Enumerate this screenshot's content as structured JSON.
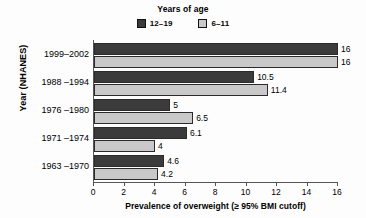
{
  "chart_data": {
    "type": "bar",
    "orientation": "horizontal",
    "title": "",
    "legend_title": "Years of age",
    "legend_position": "top-center",
    "xlabel": "Prevalence of overweight (≥ 95% BMI cutoff)",
    "ylabel": "Year (NHANES)",
    "categories": [
      "1999–2002",
      "1988 –1994",
      "1976 –1980",
      "1971 –1974",
      "1963 –1970"
    ],
    "series": [
      {
        "name": "12–19",
        "color": "#3b3b3b",
        "values": [
          16,
          10.5,
          5,
          6.1,
          4.6
        ],
        "labels": [
          "16",
          "10.5",
          "5",
          "6.1",
          "4.6"
        ]
      },
      {
        "name": "6–11",
        "color": "#c9c9c9",
        "values": [
          16,
          11.4,
          6.5,
          4,
          4.2
        ],
        "labels": [
          "16",
          "11.4",
          "6.5",
          "4",
          "4.2"
        ]
      }
    ],
    "xlim": [
      0,
      16
    ],
    "xticks": [
      0,
      2,
      4,
      6,
      8,
      10,
      12,
      14,
      16
    ],
    "xtick_labels": [
      "0",
      "2",
      "4",
      "6",
      "8",
      "10",
      "12",
      "14",
      "16"
    ],
    "grid": false
  }
}
